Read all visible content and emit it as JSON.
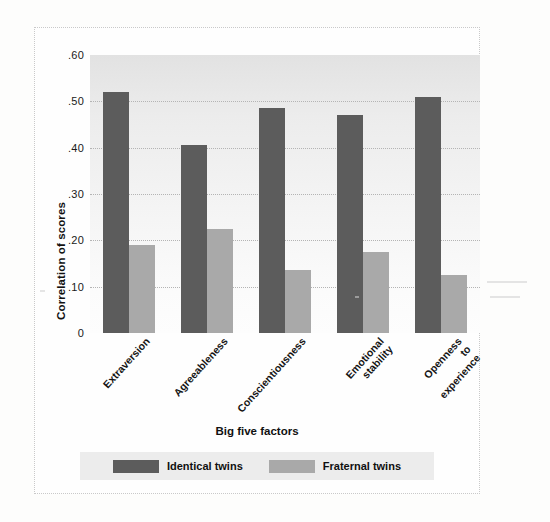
{
  "chart_data": {
    "type": "bar",
    "title": "",
    "xlabel": "Big five factors",
    "ylabel": "Correlation of scores",
    "categories": [
      "Extraversion",
      "Agreeableness",
      "Conscientiousness",
      "Emotional\nstability",
      "Openness\nto\nexperience"
    ],
    "series": [
      {
        "name": "Identical twins",
        "color": "#5c5c5c",
        "values": [
          0.52,
          0.405,
          0.485,
          0.47,
          0.51
        ]
      },
      {
        "name": "Fraternal twins",
        "color": "#a9a9a9",
        "values": [
          0.19,
          0.225,
          0.135,
          0.175,
          0.125
        ]
      }
    ],
    "ylim": [
      0,
      0.6
    ],
    "ytick_values": [
      0,
      0.1,
      0.2,
      0.3,
      0.4,
      0.5,
      0.6
    ],
    "ytick_labels": [
      "0",
      ".10",
      ".20",
      ".30",
      ".40",
      ".50",
      ".60"
    ],
    "grid": true,
    "legend_position": "bottom"
  },
  "axes": {
    "y_title": "Correlation of scores",
    "x_title": "Big five factors"
  },
  "legend": {
    "items": [
      {
        "label": "Identical twins",
        "color": "#5c5c5c"
      },
      {
        "label": "Fraternal twins",
        "color": "#a9a9a9"
      }
    ]
  },
  "colors": {
    "identical": "#5c5c5c",
    "fraternal": "#a9a9a9",
    "plot_background": "#ececec",
    "gridline": "#b4b4b4",
    "legend_background": "#ececec"
  }
}
